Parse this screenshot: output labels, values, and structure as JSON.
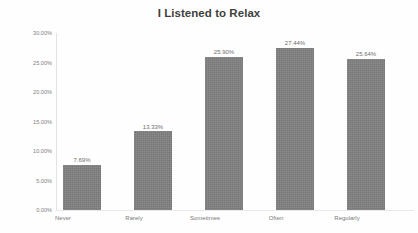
{
  "chart_data": {
    "type": "bar",
    "title": "I Listened to Relax",
    "xlabel": "",
    "ylabel": "",
    "categories": [
      "Never",
      "Rarely",
      "Sometimes",
      "Often",
      "Regularly"
    ],
    "values": [
      7.69,
      13.33,
      25.9,
      27.44,
      25.64
    ],
    "data_labels": [
      "7.69%",
      "13.33%",
      "25.90%",
      "27.44%",
      "25.64%"
    ],
    "ylim": [
      0,
      30
    ],
    "ytick_values": [
      30,
      25,
      20,
      15,
      10,
      5,
      0
    ],
    "ytick_labels": [
      "30.00%",
      "25.00%",
      "20.00%",
      "15.00%",
      "10.00%",
      "5.00%",
      "0.00%"
    ],
    "grid": false,
    "legend": false,
    "bar_color": "#808080",
    "title_color": "#3f3f3f",
    "axis_label_color": "#7a7a7a",
    "background_color": "#fefefe"
  }
}
